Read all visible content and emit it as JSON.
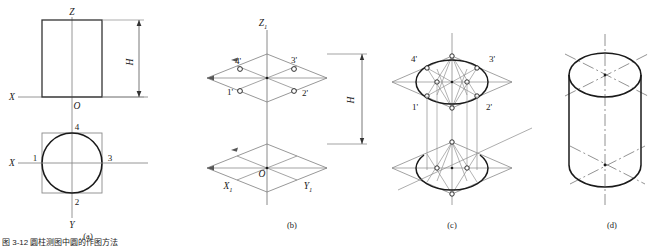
{
  "figure": {
    "caption": "图 3-12  圆柱测图中圆的作图方法",
    "caption_visible_fragment": "图 3-12",
    "panels": [
      {
        "id": "a",
        "label": "(a)",
        "title_desc": "two-view orthographic projection of a cylinder",
        "axis_labels": [
          "X",
          "Z",
          "X",
          "Y",
          "O"
        ],
        "dimension_label": "H",
        "point_labels": [
          "1",
          "2",
          "3",
          "4"
        ]
      },
      {
        "id": "b",
        "label": "(b)",
        "title_desc": "axonometric axes with two rhombus planes",
        "axis_labels": [
          "Z1",
          "X1",
          "Y1",
          "O"
        ],
        "dimension_label": "H",
        "point_labels": [
          "1'",
          "2'",
          "3'",
          "4'"
        ]
      },
      {
        "id": "c",
        "label": "(c)",
        "title_desc": "four-centre ellipse construction in both rhombi",
        "point_labels": [
          "1'",
          "2'",
          "3'",
          "4'"
        ]
      },
      {
        "id": "d",
        "label": "(d)",
        "title_desc": "finished isometric cylinder with centre lines"
      }
    ],
    "labels": {
      "X": "X",
      "Y": "Y",
      "Z": "Z",
      "O": "O",
      "H": "H",
      "Z1_base": "Z",
      "Z1_sub": "1",
      "X1_base": "X",
      "X1_sub": "1",
      "Y1_base": "Y",
      "Y1_sub": "1",
      "p1": "1",
      "p2": "2",
      "p3": "3",
      "p4": "4",
      "p1p": "1'",
      "p2p": "2'",
      "p3p": "3'",
      "p4p": "4'",
      "panel_a": "(a)",
      "panel_b": "(b)",
      "panel_c": "(c)",
      "panel_d": "(d)"
    },
    "colors": {
      "ink": "#1a1a1a",
      "thin": "#8a8a8a",
      "construction": "#9a9a9a",
      "background": "#ffffff"
    }
  }
}
